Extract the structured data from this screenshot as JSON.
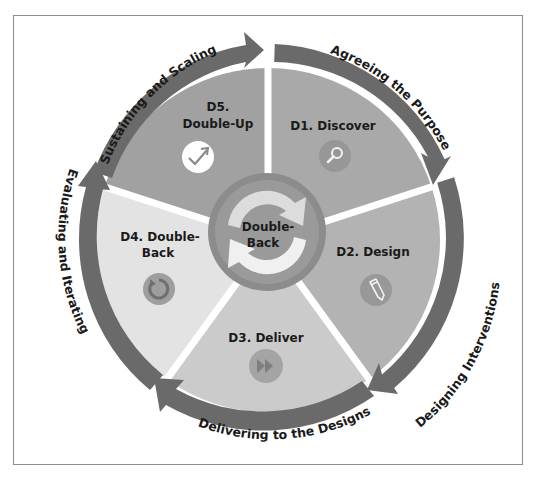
{
  "diagram": {
    "title_fragment": "",
    "cycle": [
      {
        "id": "D1",
        "label": "D1. Discover",
        "icon": "magnifier-icon",
        "fill": "#a9a9a9",
        "arc_label": "Agreeing the Purpose"
      },
      {
        "id": "D2",
        "label": "D2. Design",
        "icon": "pencil-icon",
        "fill": "#b3b3b3",
        "arc_label": "Designing Interventions"
      },
      {
        "id": "D3",
        "label": "D3. Deliver",
        "icon": "fast-forward-icon",
        "fill": "#cbcbcb",
        "arc_label": "Delivering to the Designs"
      },
      {
        "id": "D4",
        "label_line1": "D4. Double-",
        "label_line2": "Back",
        "icon": "refresh-icon",
        "fill": "#e3e3e3",
        "arc_label": "Evaluating and Iterating"
      },
      {
        "id": "D5",
        "label_line1": "D5.",
        "label_line2": "Double-Up",
        "icon": "check-arrow-icon",
        "fill": "#a1a1a1",
        "arc_label": "Sustaining and Scaling"
      }
    ],
    "hub": {
      "line1": "Double-",
      "line2": "Back",
      "icon": "cycle-arrows-icon"
    },
    "colors": {
      "arrow": "#6a6a6a",
      "hub_ring": "#8c8c8c",
      "hub_inner": "#9a9a9a",
      "icon_circle": "#8f8f8f",
      "text": "#1a1a1a",
      "frame": "#8e8e8e"
    }
  }
}
